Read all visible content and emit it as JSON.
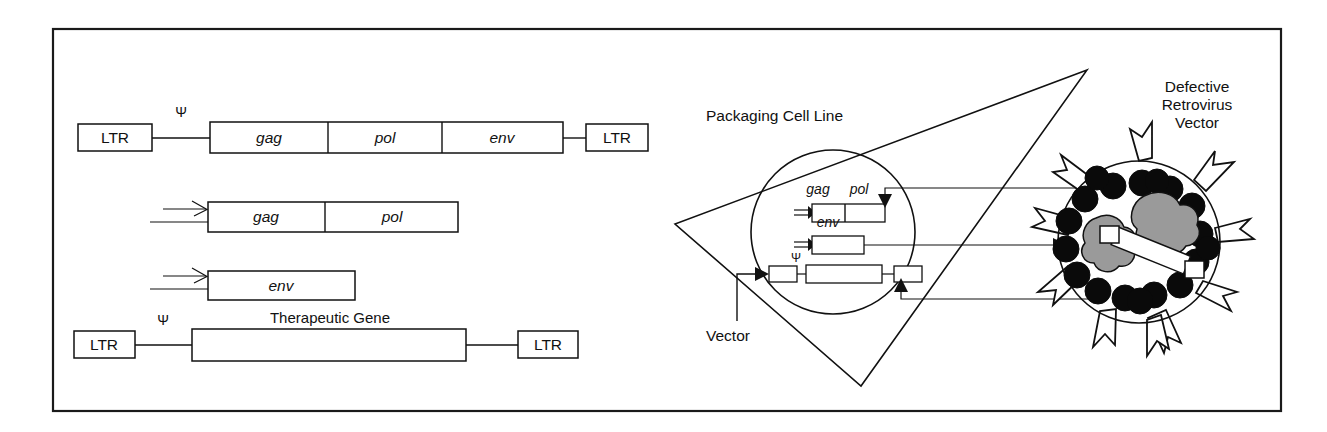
{
  "figure": {
    "background": "#ffffff",
    "frame_color": "#1a1a1a",
    "ink_color": "#111111",
    "protein_fill": "#9a9a9a",
    "capsid_fill": "#0a0a0a"
  },
  "left_panel": {
    "rows": [
      {
        "id": "wild-type-provirus",
        "left_ltr": "LTR",
        "psi": "Ψ",
        "genes": [
          "gag",
          "pol",
          "env"
        ],
        "right_ltr": "LTR"
      },
      {
        "id": "gag-pol-construct",
        "genes": [
          "gag",
          "pol"
        ],
        "has_promoter_arrow": true
      },
      {
        "id": "env-construct",
        "genes": [
          "env"
        ],
        "has_promoter_arrow": true
      },
      {
        "id": "therapeutic-vector",
        "left_ltr": "LTR",
        "psi": "Ψ",
        "insert_label": "Therapeutic Gene",
        "right_ltr": "LTR"
      }
    ]
  },
  "right_panel": {
    "packaging_cell_label": "Packaging Cell Line",
    "vector_label": "Vector",
    "virus_label_lines": [
      "Defective",
      "Retrovirus",
      "Vector"
    ],
    "cell_contents": [
      {
        "id": "cell-gag-pol",
        "genes": [
          "gag",
          "pol"
        ],
        "has_promoter_arrow": true
      },
      {
        "id": "cell-env",
        "genes": [
          "env"
        ],
        "has_promoter_arrow": true
      },
      {
        "id": "cell-vector",
        "psi": "Ψ",
        "segments": [
          "LTR",
          "Therapeutic Gene",
          "LTR"
        ]
      }
    ],
    "virion": {
      "spike_count": 10,
      "capsid_dot_count": 18,
      "protein_blob_count": 2,
      "rna_genome_count": 1
    }
  }
}
